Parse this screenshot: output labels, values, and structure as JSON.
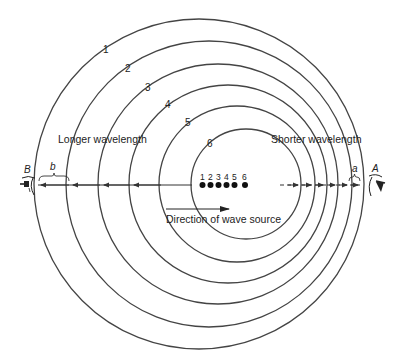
{
  "diagram": {
    "labels": {
      "longer": "Longer wavelength",
      "shorter": "Shorter wavelength",
      "direction": "Direction of wave source",
      "observer_left": "B",
      "observer_right": "A",
      "spacing_left": "b",
      "spacing_right": "a"
    },
    "wavefronts": [
      {
        "label": "1",
        "cx": 199,
        "cy": 184,
        "r": 165
      },
      {
        "label": "2",
        "cx": 209,
        "cy": 184,
        "r": 143
      },
      {
        "label": "3",
        "cx": 218,
        "cy": 184,
        "r": 120
      },
      {
        "label": "4",
        "cx": 228,
        "cy": 184,
        "r": 99
      },
      {
        "label": "5",
        "cx": 237,
        "cy": 184,
        "r": 78
      },
      {
        "label": "6",
        "cx": 246,
        "cy": 184,
        "r": 55
      }
    ],
    "source_positions": [
      "1",
      "2",
      "3",
      "4",
      "5",
      "6"
    ],
    "colors": {
      "line": "#444444",
      "background": "#ffffff"
    }
  }
}
